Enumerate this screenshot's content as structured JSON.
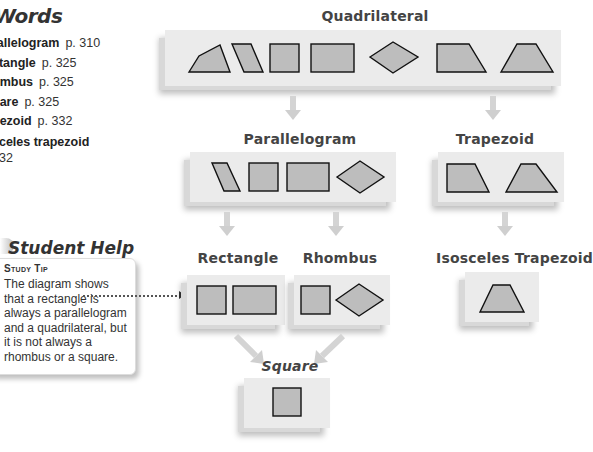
{
  "key_words": {
    "title": "Words",
    "items": [
      {
        "term": "rallelogram",
        "page": "p. 310"
      },
      {
        "term": "ctangle",
        "page": "p. 325"
      },
      {
        "term": "ombus",
        "page": "p. 325"
      },
      {
        "term": "uare",
        "page": "p. 325"
      },
      {
        "term": "pezoid",
        "page": "p. 332"
      },
      {
        "term": "sceles trapezoid",
        "page": "332"
      }
    ]
  },
  "student_help": {
    "title": "Student Help",
    "tip_label": "Study Tip",
    "tip_text": "The diagram shows that a rectangle is always a parallelogram and a quadrilateral, but it is not always a rhombus or a square."
  },
  "diagram": {
    "nodes": {
      "quadrilateral": {
        "label": "Quadrilateral",
        "shapes": [
          "general-quadrilateral",
          "parallelogram",
          "square",
          "rectangle",
          "rhombus",
          "trapezoid",
          "isosceles-trapezoid"
        ]
      },
      "parallelogram": {
        "label": "Parallelogram",
        "shapes": [
          "parallelogram",
          "square",
          "rectangle",
          "rhombus"
        ]
      },
      "trapezoid": {
        "label": "Trapezoid",
        "shapes": [
          "trapezoid",
          "isosceles-trapezoid"
        ]
      },
      "rectangle": {
        "label": "Rectangle",
        "shapes": [
          "square",
          "rectangle"
        ]
      },
      "rhombus": {
        "label": "Rhombus",
        "shapes": [
          "square",
          "rhombus"
        ]
      },
      "isosceles_trapezoid": {
        "label": "Isosceles Trapezoid",
        "shapes": [
          "isosceles-trapezoid"
        ]
      },
      "square": {
        "label": "Square",
        "shapes": [
          "square"
        ]
      }
    },
    "edges": [
      [
        "Quadrilateral",
        "Parallelogram"
      ],
      [
        "Quadrilateral",
        "Trapezoid"
      ],
      [
        "Parallelogram",
        "Rectangle"
      ],
      [
        "Parallelogram",
        "Rhombus"
      ],
      [
        "Trapezoid",
        "Isosceles Trapezoid"
      ],
      [
        "Rectangle",
        "Square"
      ],
      [
        "Rhombus",
        "Square"
      ]
    ],
    "colors": {
      "panel": "#ebebeb",
      "shape_fill": "#bdbdbd",
      "arrow": "#d0d0d0",
      "label": "#444444"
    }
  }
}
